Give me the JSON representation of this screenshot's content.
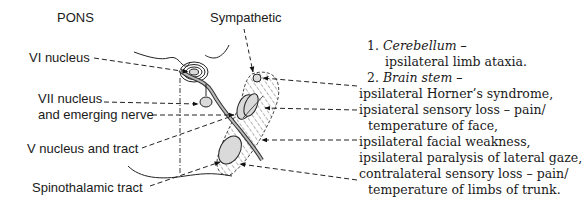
{
  "title": "PONS",
  "labels": {
    "sympathetic": "Sympathetic",
    "vi_nucleus": "VI nucleus",
    "vii_nucleus_line1": "VII nucleus",
    "vii_nucleus_line2": "and emerging nerve",
    "v_nucleus": "V nucleus and tract",
    "spinothalamic": "Spinothalamic tract"
  },
  "findings": [
    {
      "num": "1.",
      "heading": "Cerebellum –",
      "lines": [
        "ipsilateral limb ataxia."
      ]
    },
    {
      "num": "2.",
      "heading": "Brain stem –",
      "lines": [
        "ipsilateral Horner’s syndrome,",
        "ipsiateral sensory loss – pain/",
        "temperature of face,",
        "ipsilateral facial weakness,",
        "ipsilateral paralysis of lateral gaze,",
        "contralateral sensory loss – pain/",
        "temperature of limbs of trunk."
      ]
    }
  ]
}
